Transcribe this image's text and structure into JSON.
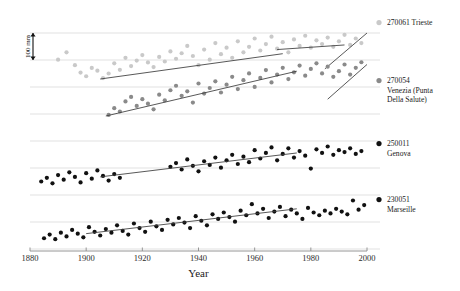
{
  "chart_data": {
    "type": "scatter",
    "title": "",
    "xlabel": "Year",
    "ylabel": "",
    "xlim": [
      1880,
      2000
    ],
    "ylim": [
      0,
      1
    ],
    "xticks": [
      1880,
      1900,
      1920,
      1940,
      1960,
      1980,
      2000
    ],
    "xticklabels": [
      "1880",
      "1900",
      "1920",
      "1940",
      "1960",
      "1980",
      "2000"
    ],
    "grid": "horizontal",
    "grid_count": 9,
    "legend_position": "right",
    "scale_bar": {
      "label": "100 mm",
      "orientation": "vertical",
      "spans_gridlines": 1
    },
    "series": [
      {
        "name": "270061 Trieste",
        "station_id": "270061",
        "station": "Trieste",
        "color": "#c9c9c9",
        "marker": "circle",
        "offset_band": 0,
        "trend_lines": [
          {
            "x": [
              1905,
              1970
            ],
            "y": [
              0.0,
              0.55
            ]
          },
          {
            "x": [
              1968,
              1992
            ],
            "y": [
              0.64,
              0.74
            ]
          },
          {
            "x": [
              1985,
              2000
            ],
            "y": [
              0.22,
              1.0
            ]
          }
        ],
        "points": [
          {
            "x": 1890,
            "y": 0.42
          },
          {
            "x": 1893,
            "y": 0.58
          },
          {
            "x": 1896,
            "y": 0.3
          },
          {
            "x": 1898,
            "y": 0.14
          },
          {
            "x": 1900,
            "y": 0.06
          },
          {
            "x": 1902,
            "y": 0.24
          },
          {
            "x": 1904,
            "y": 0.18
          },
          {
            "x": 1906,
            "y": 0.02
          },
          {
            "x": 1908,
            "y": 0.12
          },
          {
            "x": 1910,
            "y": 0.34
          },
          {
            "x": 1912,
            "y": 0.2
          },
          {
            "x": 1914,
            "y": 0.46
          },
          {
            "x": 1916,
            "y": 0.28
          },
          {
            "x": 1918,
            "y": 0.4
          },
          {
            "x": 1920,
            "y": 0.52
          },
          {
            "x": 1922,
            "y": 0.36
          },
          {
            "x": 1924,
            "y": 0.26
          },
          {
            "x": 1926,
            "y": 0.48
          },
          {
            "x": 1928,
            "y": 0.38
          },
          {
            "x": 1930,
            "y": 0.6
          },
          {
            "x": 1932,
            "y": 0.44
          },
          {
            "x": 1934,
            "y": 0.56
          },
          {
            "x": 1936,
            "y": 0.72
          },
          {
            "x": 1938,
            "y": 0.5
          },
          {
            "x": 1940,
            "y": 0.3
          },
          {
            "x": 1942,
            "y": 0.64
          },
          {
            "x": 1944,
            "y": 0.42
          },
          {
            "x": 1946,
            "y": 0.78
          },
          {
            "x": 1948,
            "y": 0.54
          },
          {
            "x": 1950,
            "y": 0.68
          },
          {
            "x": 1952,
            "y": 0.46
          },
          {
            "x": 1954,
            "y": 0.82
          },
          {
            "x": 1956,
            "y": 0.58
          },
          {
            "x": 1958,
            "y": 0.7
          },
          {
            "x": 1960,
            "y": 0.88
          },
          {
            "x": 1962,
            "y": 0.62
          },
          {
            "x": 1964,
            "y": 0.76
          },
          {
            "x": 1966,
            "y": 0.92
          },
          {
            "x": 1968,
            "y": 0.66
          },
          {
            "x": 1970,
            "y": 0.8
          },
          {
            "x": 1972,
            "y": 0.58
          },
          {
            "x": 1974,
            "y": 0.86
          },
          {
            "x": 1976,
            "y": 0.72
          },
          {
            "x": 1978,
            "y": 0.94
          },
          {
            "x": 1980,
            "y": 0.68
          },
          {
            "x": 1982,
            "y": 0.84
          },
          {
            "x": 1984,
            "y": 0.76
          },
          {
            "x": 1986,
            "y": 0.9
          },
          {
            "x": 1988,
            "y": 0.7
          },
          {
            "x": 1990,
            "y": 0.82
          },
          {
            "x": 1992,
            "y": 0.96
          },
          {
            "x": 1994,
            "y": 0.74
          },
          {
            "x": 1996,
            "y": 0.88
          },
          {
            "x": 1998,
            "y": 0.78
          }
        ]
      },
      {
        "name": "270054 Venezia (Punta Della Salute)",
        "station_id": "270054",
        "station": "Venezia (Punta Della Salute)",
        "color": "#8a8a8a",
        "marker": "circle",
        "offset_band": 1,
        "trend_lines": [
          {
            "x": [
              1907,
              1975
            ],
            "y": [
              0.0,
              0.8
            ]
          },
          {
            "x": [
              1986,
              2000
            ],
            "y": [
              0.3,
              0.92
            ]
          }
        ],
        "points": [
          {
            "x": 1908,
            "y": 0.02
          },
          {
            "x": 1910,
            "y": 0.14
          },
          {
            "x": 1912,
            "y": 0.08
          },
          {
            "x": 1914,
            "y": 0.26
          },
          {
            "x": 1916,
            "y": 0.34
          },
          {
            "x": 1918,
            "y": 0.18
          },
          {
            "x": 1920,
            "y": 0.3
          },
          {
            "x": 1922,
            "y": 0.22
          },
          {
            "x": 1924,
            "y": 0.12
          },
          {
            "x": 1926,
            "y": 0.38
          },
          {
            "x": 1928,
            "y": 0.28
          },
          {
            "x": 1930,
            "y": 0.46
          },
          {
            "x": 1932,
            "y": 0.54
          },
          {
            "x": 1934,
            "y": 0.36
          },
          {
            "x": 1936,
            "y": 0.44
          },
          {
            "x": 1938,
            "y": 0.24
          },
          {
            "x": 1940,
            "y": 0.58
          },
          {
            "x": 1942,
            "y": 0.4
          },
          {
            "x": 1944,
            "y": 0.5
          },
          {
            "x": 1946,
            "y": 0.62
          },
          {
            "x": 1948,
            "y": 0.42
          },
          {
            "x": 1950,
            "y": 0.56
          },
          {
            "x": 1952,
            "y": 0.7
          },
          {
            "x": 1954,
            "y": 0.48
          },
          {
            "x": 1956,
            "y": 0.64
          },
          {
            "x": 1958,
            "y": 0.76
          },
          {
            "x": 1960,
            "y": 0.52
          },
          {
            "x": 1962,
            "y": 0.68
          },
          {
            "x": 1964,
            "y": 0.82
          },
          {
            "x": 1966,
            "y": 0.6
          },
          {
            "x": 1968,
            "y": 0.74
          },
          {
            "x": 1970,
            "y": 0.86
          },
          {
            "x": 1972,
            "y": 0.66
          },
          {
            "x": 1974,
            "y": 0.78
          },
          {
            "x": 1976,
            "y": 0.9
          },
          {
            "x": 1978,
            "y": 0.72
          },
          {
            "x": 1980,
            "y": 0.84
          },
          {
            "x": 1982,
            "y": 0.94
          },
          {
            "x": 1984,
            "y": 0.76
          },
          {
            "x": 1986,
            "y": 0.88
          },
          {
            "x": 1988,
            "y": 0.7
          },
          {
            "x": 1990,
            "y": 0.8
          },
          {
            "x": 1992,
            "y": 0.92
          },
          {
            "x": 1994,
            "y": 0.74
          },
          {
            "x": 1996,
            "y": 0.86
          },
          {
            "x": 1998,
            "y": 0.96
          }
        ]
      },
      {
        "name": "250011 Genova",
        "station_id": "250011",
        "station": "Genova",
        "color": "#111111",
        "marker": "circle",
        "offset_band": 2,
        "trend_lines": [
          {
            "x": [
              1905,
              1975
            ],
            "y": [
              0.22,
              0.74
            ]
          }
        ],
        "points": [
          {
            "x": 1884,
            "y": 0.12
          },
          {
            "x": 1886,
            "y": 0.2
          },
          {
            "x": 1888,
            "y": 0.08
          },
          {
            "x": 1890,
            "y": 0.26
          },
          {
            "x": 1892,
            "y": 0.16
          },
          {
            "x": 1894,
            "y": 0.32
          },
          {
            "x": 1896,
            "y": 0.22
          },
          {
            "x": 1898,
            "y": 0.1
          },
          {
            "x": 1900,
            "y": 0.3
          },
          {
            "x": 1902,
            "y": 0.18
          },
          {
            "x": 1904,
            "y": 0.36
          },
          {
            "x": 1906,
            "y": 0.24
          },
          {
            "x": 1908,
            "y": 0.14
          },
          {
            "x": 1910,
            "y": 0.28
          },
          {
            "x": 1912,
            "y": 0.2
          },
          {
            "x": 1930,
            "y": 0.44
          },
          {
            "x": 1932,
            "y": 0.52
          },
          {
            "x": 1934,
            "y": 0.38
          },
          {
            "x": 1936,
            "y": 0.6
          },
          {
            "x": 1938,
            "y": 0.46
          },
          {
            "x": 1940,
            "y": 0.34
          },
          {
            "x": 1942,
            "y": 0.56
          },
          {
            "x": 1944,
            "y": 0.48
          },
          {
            "x": 1946,
            "y": 0.64
          },
          {
            "x": 1948,
            "y": 0.42
          },
          {
            "x": 1950,
            "y": 0.58
          },
          {
            "x": 1952,
            "y": 0.7
          },
          {
            "x": 1954,
            "y": 0.5
          },
          {
            "x": 1956,
            "y": 0.66
          },
          {
            "x": 1958,
            "y": 0.54
          },
          {
            "x": 1960,
            "y": 0.8
          },
          {
            "x": 1962,
            "y": 0.62
          },
          {
            "x": 1964,
            "y": 0.74
          },
          {
            "x": 1966,
            "y": 0.86
          },
          {
            "x": 1968,
            "y": 0.58
          },
          {
            "x": 1970,
            "y": 0.72
          },
          {
            "x": 1972,
            "y": 0.84
          },
          {
            "x": 1974,
            "y": 0.64
          },
          {
            "x": 1976,
            "y": 0.78
          },
          {
            "x": 1978,
            "y": 0.68
          },
          {
            "x": 1980,
            "y": 0.4
          },
          {
            "x": 1982,
            "y": 0.82
          },
          {
            "x": 1984,
            "y": 0.74
          },
          {
            "x": 1986,
            "y": 0.88
          },
          {
            "x": 1988,
            "y": 0.7
          },
          {
            "x": 1990,
            "y": 0.8
          },
          {
            "x": 1992,
            "y": 0.76
          },
          {
            "x": 1994,
            "y": 0.84
          },
          {
            "x": 1996,
            "y": 0.72
          },
          {
            "x": 1998,
            "y": 0.78
          }
        ]
      },
      {
        "name": "230051 Marseille",
        "station_id": "230051",
        "station": "Marseille",
        "color": "#111111",
        "marker": "circle",
        "offset_band": 3,
        "trend_lines": [
          {
            "x": [
              1900,
              1975
            ],
            "y": [
              0.16,
              0.7
            ]
          }
        ],
        "points": [
          {
            "x": 1885,
            "y": 0.06
          },
          {
            "x": 1887,
            "y": 0.14
          },
          {
            "x": 1889,
            "y": 0.04
          },
          {
            "x": 1891,
            "y": 0.18
          },
          {
            "x": 1893,
            "y": 0.1
          },
          {
            "x": 1895,
            "y": 0.24
          },
          {
            "x": 1897,
            "y": 0.16
          },
          {
            "x": 1899,
            "y": 0.08
          },
          {
            "x": 1901,
            "y": 0.3
          },
          {
            "x": 1903,
            "y": 0.2
          },
          {
            "x": 1905,
            "y": 0.12
          },
          {
            "x": 1907,
            "y": 0.26
          },
          {
            "x": 1909,
            "y": 0.18
          },
          {
            "x": 1911,
            "y": 0.34
          },
          {
            "x": 1913,
            "y": 0.22
          },
          {
            "x": 1915,
            "y": 0.14
          },
          {
            "x": 1917,
            "y": 0.38
          },
          {
            "x": 1919,
            "y": 0.28
          },
          {
            "x": 1921,
            "y": 0.2
          },
          {
            "x": 1923,
            "y": 0.42
          },
          {
            "x": 1925,
            "y": 0.32
          },
          {
            "x": 1927,
            "y": 0.24
          },
          {
            "x": 1929,
            "y": 0.46
          },
          {
            "x": 1931,
            "y": 0.36
          },
          {
            "x": 1933,
            "y": 0.5
          },
          {
            "x": 1935,
            "y": 0.4
          },
          {
            "x": 1937,
            "y": 0.28
          },
          {
            "x": 1939,
            "y": 0.54
          },
          {
            "x": 1941,
            "y": 0.44
          },
          {
            "x": 1943,
            "y": 0.34
          },
          {
            "x": 1945,
            "y": 0.58
          },
          {
            "x": 1947,
            "y": 0.48
          },
          {
            "x": 1949,
            "y": 0.62
          },
          {
            "x": 1951,
            "y": 0.52
          },
          {
            "x": 1953,
            "y": 0.42
          },
          {
            "x": 1955,
            "y": 0.66
          },
          {
            "x": 1957,
            "y": 0.56
          },
          {
            "x": 1959,
            "y": 0.8
          },
          {
            "x": 1961,
            "y": 0.6
          },
          {
            "x": 1963,
            "y": 0.7
          },
          {
            "x": 1965,
            "y": 0.5
          },
          {
            "x": 1967,
            "y": 0.64
          },
          {
            "x": 1969,
            "y": 0.74
          },
          {
            "x": 1971,
            "y": 0.54
          },
          {
            "x": 1973,
            "y": 0.68
          },
          {
            "x": 1975,
            "y": 0.6
          },
          {
            "x": 1977,
            "y": 0.48
          },
          {
            "x": 1979,
            "y": 0.72
          },
          {
            "x": 1981,
            "y": 0.62
          },
          {
            "x": 1983,
            "y": 0.56
          },
          {
            "x": 1985,
            "y": 0.66
          },
          {
            "x": 1987,
            "y": 0.6
          },
          {
            "x": 1989,
            "y": 0.7
          },
          {
            "x": 1991,
            "y": 0.64
          },
          {
            "x": 1993,
            "y": 0.58
          },
          {
            "x": 1995,
            "y": 0.88
          },
          {
            "x": 1997,
            "y": 0.68
          },
          {
            "x": 1999,
            "y": 0.78
          }
        ]
      }
    ]
  },
  "legend": {
    "entries": [
      {
        "label_id": "270061 Trieste",
        "line1": "270061 Trieste",
        "line2": "",
        "line3": "",
        "color": "#c9c9c9"
      },
      {
        "label_id": "270054 Venezia",
        "line1": "270054",
        "line2": "Venezia (Punta",
        "line3": "Della Salute)",
        "color": "#8a8a8a"
      },
      {
        "label_id": "250011 Genova",
        "line1": "250011",
        "line2": "Genova",
        "line3": "",
        "color": "#111111"
      },
      {
        "label_id": "230051 Marseille",
        "line1": "230051",
        "line2": "Marseille",
        "line3": "",
        "color": "#111111"
      }
    ]
  },
  "axis": {
    "x_title": "Year",
    "tick_1880": "1880",
    "tick_1900": "1900",
    "tick_1920": "1920",
    "tick_1940": "1940",
    "tick_1960": "1960",
    "tick_1980": "1980",
    "tick_2000": "2000"
  },
  "scalebar": {
    "label": "100 mm"
  }
}
